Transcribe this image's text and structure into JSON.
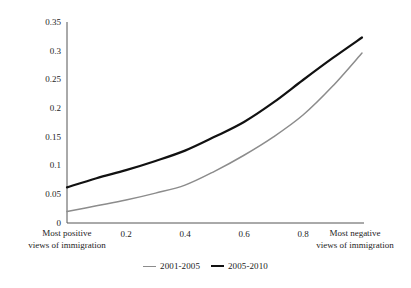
{
  "chart_data": {
    "type": "line",
    "title": "",
    "subtitle": "",
    "xlabel": "",
    "ylabel": "",
    "xlim": [
      0,
      1
    ],
    "ylim": [
      0,
      0.35
    ],
    "grid": false,
    "legend_position": "bottom-center",
    "x_tick_values": [
      0.2,
      0.4,
      0.6,
      0.8
    ],
    "x_tick_labels": [
      "0.2",
      "0.4",
      "0.6",
      "0.8"
    ],
    "x_axis_start_label": {
      "line1": "Most positive",
      "line2": "views of immigration",
      "value": 0
    },
    "x_axis_end_label": {
      "line1": "Most negative",
      "line2": "views of immigration",
      "value": 1
    },
    "y_tick_values": [
      0,
      0.05,
      0.1,
      0.15,
      0.2,
      0.25,
      0.3,
      0.35
    ],
    "y_tick_labels": [
      "0",
      "0.05",
      "0.1",
      "0.15",
      "0.2",
      "0.25",
      "0.3",
      "0.35"
    ],
    "x": [
      0,
      0.1,
      0.2,
      0.3,
      0.4,
      0.5,
      0.6,
      0.7,
      0.8,
      0.9,
      1.0
    ],
    "series": [
      {
        "name": "2001-2005",
        "color": "#8c8c8c",
        "width": 1.5,
        "values": [
          0.02,
          0.03,
          0.04,
          0.052,
          0.066,
          0.09,
          0.118,
          0.15,
          0.188,
          0.238,
          0.296
        ]
      },
      {
        "name": "2005-2010",
        "color": "#111111",
        "width": 2.2,
        "values": [
          0.062,
          0.078,
          0.092,
          0.108,
          0.126,
          0.15,
          0.176,
          0.21,
          0.249,
          0.287,
          0.323
        ]
      }
    ]
  },
  "legend": {
    "entries": [
      {
        "label": "2001-2005"
      },
      {
        "label": "2005-2010"
      }
    ]
  },
  "axis": {
    "line_color": "#4d4d4d"
  }
}
